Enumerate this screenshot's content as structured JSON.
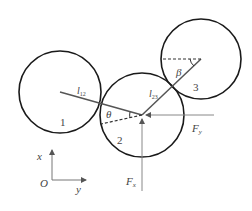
{
  "diagram": {
    "type": "mechanics free-body diagram of three contacting circles",
    "circles": [
      {
        "id": "1",
        "label": "1",
        "cx": 60,
        "cy": 92,
        "r": 41
      },
      {
        "id": "2",
        "label": "2",
        "cx": 142,
        "cy": 115,
        "r": 42
      },
      {
        "id": "3",
        "label": "3",
        "cx": 201,
        "cy": 59,
        "r": 40
      }
    ],
    "links": [
      {
        "label": "l",
        "subscript": "12",
        "from": "1",
        "to": "2"
      },
      {
        "label": "l",
        "subscript": "23",
        "from": "2",
        "to": "3"
      }
    ],
    "angles": [
      {
        "symbol": "θ",
        "at": "2"
      },
      {
        "symbol": "β",
        "at": "3"
      }
    ],
    "forces": [
      {
        "label": "F",
        "subscript": "y",
        "direction": "horizontal"
      },
      {
        "label": "F",
        "subscript": "x",
        "direction": "vertical"
      }
    ],
    "axes": {
      "origin": "O",
      "vertical": "x",
      "horizontal": "y"
    }
  },
  "colors": {
    "circle_stroke": "#1a1a1a",
    "line": "#555555",
    "thin_line": "#888888",
    "text": "#444444"
  }
}
